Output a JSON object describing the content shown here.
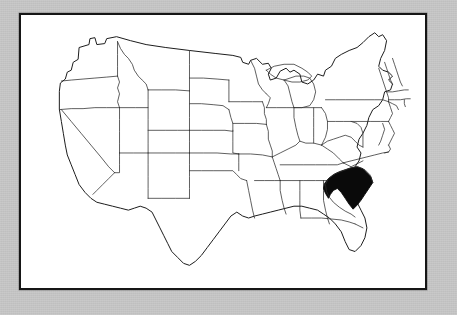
{
  "figure": {
    "kind": "map",
    "projection_style": "outline map, state boundaries",
    "render_style": "scanned black-and-white line art",
    "highlighted_state": "South Carolina",
    "highlighted_state_abbr": "SC",
    "caption": "",
    "title": ""
  },
  "colors": {
    "page_background": "#c9c9c9",
    "frame_border": "#161616",
    "map_background": "#ffffff",
    "state_border_line": "#2b2b2b",
    "nation_outline_line": "#1c1c1c",
    "highlight_fill": "#0a0a0a"
  },
  "frame": {
    "x": 19,
    "y": 13,
    "width": 408,
    "height": 277,
    "border_width_px": 2
  },
  "map": {
    "highlighted": [
      "South Carolina"
    ],
    "states": [
      {
        "abbr": "WA",
        "name": "Washington"
      },
      {
        "abbr": "OR",
        "name": "Oregon"
      },
      {
        "abbr": "CA",
        "name": "California"
      },
      {
        "abbr": "NV",
        "name": "Nevada"
      },
      {
        "abbr": "ID",
        "name": "Idaho"
      },
      {
        "abbr": "MT",
        "name": "Montana"
      },
      {
        "abbr": "WY",
        "name": "Wyoming"
      },
      {
        "abbr": "UT",
        "name": "Utah"
      },
      {
        "abbr": "AZ",
        "name": "Arizona"
      },
      {
        "abbr": "CO",
        "name": "Colorado"
      },
      {
        "abbr": "NM",
        "name": "New Mexico"
      },
      {
        "abbr": "ND",
        "name": "North Dakota"
      },
      {
        "abbr": "SD",
        "name": "South Dakota"
      },
      {
        "abbr": "NE",
        "name": "Nebraska"
      },
      {
        "abbr": "KS",
        "name": "Kansas"
      },
      {
        "abbr": "OK",
        "name": "Oklahoma"
      },
      {
        "abbr": "TX",
        "name": "Texas"
      },
      {
        "abbr": "MN",
        "name": "Minnesota"
      },
      {
        "abbr": "IA",
        "name": "Iowa"
      },
      {
        "abbr": "MO",
        "name": "Missouri"
      },
      {
        "abbr": "AR",
        "name": "Arkansas"
      },
      {
        "abbr": "LA",
        "name": "Louisiana"
      },
      {
        "abbr": "WI",
        "name": "Wisconsin"
      },
      {
        "abbr": "IL",
        "name": "Illinois"
      },
      {
        "abbr": "MI",
        "name": "Michigan"
      },
      {
        "abbr": "IN",
        "name": "Indiana"
      },
      {
        "abbr": "OH",
        "name": "Ohio"
      },
      {
        "abbr": "KY",
        "name": "Kentucky"
      },
      {
        "abbr": "TN",
        "name": "Tennessee"
      },
      {
        "abbr": "MS",
        "name": "Mississippi"
      },
      {
        "abbr": "AL",
        "name": "Alabama"
      },
      {
        "abbr": "GA",
        "name": "Georgia"
      },
      {
        "abbr": "FL",
        "name": "Florida"
      },
      {
        "abbr": "SC",
        "name": "South Carolina"
      },
      {
        "abbr": "NC",
        "name": "North Carolina"
      },
      {
        "abbr": "VA",
        "name": "Virginia"
      },
      {
        "abbr": "WV",
        "name": "West Virginia"
      },
      {
        "abbr": "MD",
        "name": "Maryland"
      },
      {
        "abbr": "DE",
        "name": "Delaware"
      },
      {
        "abbr": "PA",
        "name": "Pennsylvania"
      },
      {
        "abbr": "NJ",
        "name": "New Jersey"
      },
      {
        "abbr": "NY",
        "name": "New York"
      },
      {
        "abbr": "CT",
        "name": "Connecticut"
      },
      {
        "abbr": "RI",
        "name": "Rhode Island"
      },
      {
        "abbr": "MA",
        "name": "Massachusetts"
      },
      {
        "abbr": "VT",
        "name": "Vermont"
      },
      {
        "abbr": "NH",
        "name": "New Hampshire"
      },
      {
        "abbr": "ME",
        "name": "Maine"
      }
    ]
  }
}
